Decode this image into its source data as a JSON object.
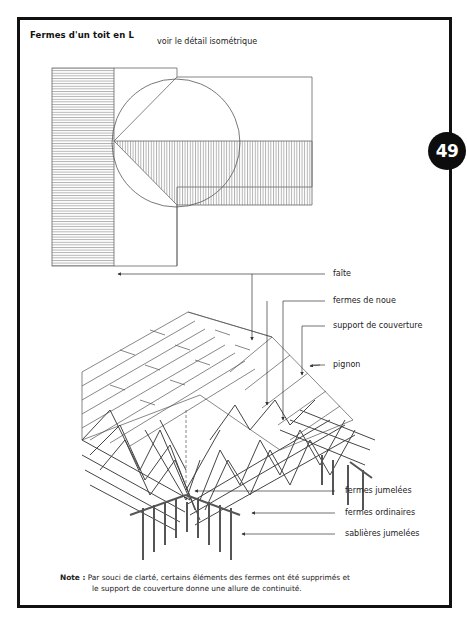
{
  "page": {
    "title": "Fermes d'un toit en L",
    "subtitle": "voir le détail isométrique",
    "badge": "49"
  },
  "callouts": [
    {
      "id": "faite",
      "label": "faîte"
    },
    {
      "id": "fermes-de-noue",
      "label": "fermes de noue"
    },
    {
      "id": "support-de-couverture",
      "label": "support de couverture"
    },
    {
      "id": "pignon",
      "label": "pignon"
    },
    {
      "id": "fermes-jumelees",
      "label": "fermes jumelées"
    },
    {
      "id": "fermes-ordinaires",
      "label": "fermes ordinaires"
    },
    {
      "id": "sablieres-jumelees",
      "label": "sablières jumelées"
    }
  ],
  "note": {
    "prefix": "Note :",
    "line1": "Par souci de clarté, certains éléments des fermes ont été supprimés et",
    "line2": "le support de couverture donne une allure de continuité."
  },
  "colors": {
    "frame": "#111111",
    "badge_bg": "#0d0d0d",
    "badge_text": "#ffffff",
    "line": "#555555",
    "hatch": "#7a7a7a"
  }
}
